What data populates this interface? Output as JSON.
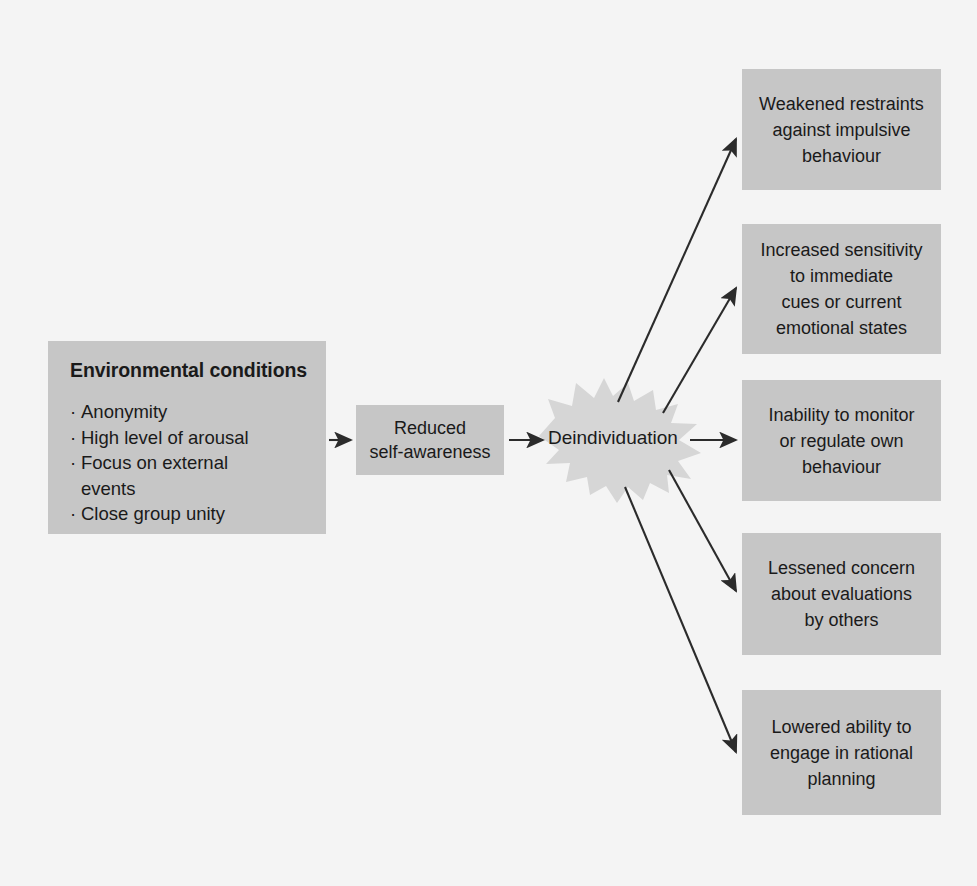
{
  "diagram": {
    "background_color": "#f4f4f4",
    "box_color": "#c6c6c6",
    "burst_color": "#d6d6d6",
    "arrow_color": "#2b2b2b",
    "text_color": "#1a1a1a"
  },
  "environmental_conditions": {
    "heading": "Environmental conditions",
    "bullets": [
      "Anonymity",
      "High level of arousal",
      "Focus on external events",
      "Close group unity"
    ],
    "bullet_lines": [
      [
        "Anonymity"
      ],
      [
        "High level of arousal"
      ],
      [
        "Focus on external",
        "events"
      ],
      [
        "Close group unity"
      ]
    ],
    "bullet_char": "·"
  },
  "reduced_self_awareness": {
    "lines": [
      "Reduced",
      "self-awareness"
    ],
    "text": "Reduced self-awareness"
  },
  "deindividuation": {
    "label": "Deindividuation",
    "shape": "starburst"
  },
  "outcomes": [
    {
      "id": "weakened-restraints",
      "lines": [
        "Weakened restraints",
        "against impulsive",
        "behaviour"
      ],
      "text": "Weakened restraints against impulsive behaviour"
    },
    {
      "id": "increased-sensitivity",
      "lines": [
        "Increased sensitivity",
        "to immediate",
        "cues or current",
        "emotional states"
      ],
      "text": "Increased sensitivity to immediate cues or current emotional states"
    },
    {
      "id": "inability-to-monitor",
      "lines": [
        "Inability to monitor",
        "or regulate own",
        "behaviour"
      ],
      "text": "Inability to monitor or regulate own behaviour"
    },
    {
      "id": "lessened-concern",
      "lines": [
        "Lessened concern",
        "about evaluations",
        "by others"
      ],
      "text": "Lessened concern about evaluations by others"
    },
    {
      "id": "lowered-ability",
      "lines": [
        "Lowered ability to",
        "engage in rational",
        "planning"
      ],
      "text": "Lowered ability to engage in rational planning"
    }
  ],
  "connections": [
    {
      "from": "environmental-conditions",
      "to": "reduced-self-awareness"
    },
    {
      "from": "reduced-self-awareness",
      "to": "deindividuation"
    },
    {
      "from": "deindividuation",
      "to": "weakened-restraints"
    },
    {
      "from": "deindividuation",
      "to": "increased-sensitivity"
    },
    {
      "from": "deindividuation",
      "to": "inability-to-monitor"
    },
    {
      "from": "deindividuation",
      "to": "lessened-concern"
    },
    {
      "from": "deindividuation",
      "to": "lowered-ability"
    }
  ]
}
